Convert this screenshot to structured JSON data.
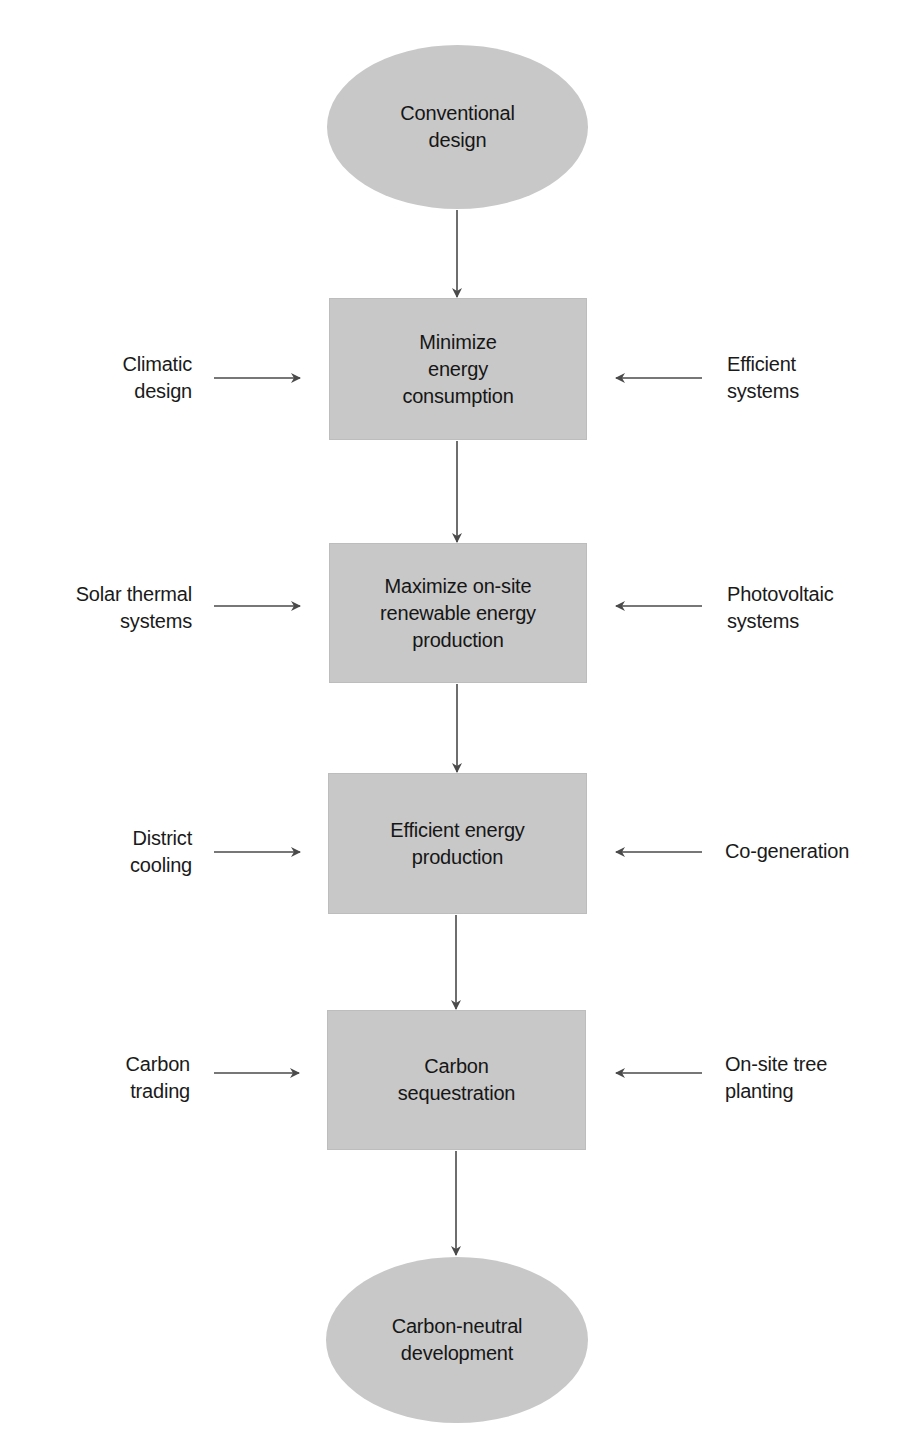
{
  "diagram": {
    "type": "flowchart",
    "colors": {
      "node_fill": "#c8c8c8",
      "arrow": "#4a4a4a",
      "text": "#1a1a1a",
      "background": "#ffffff"
    },
    "start": {
      "shape": "ellipse",
      "label": "Conventional\ndesign"
    },
    "steps": [
      {
        "label": "Minimize\nenergy\nconsumption",
        "left_input": "Climatic\ndesign",
        "right_input": "Efficient\nsystems"
      },
      {
        "label": "Maximize on-site\nrenewable energy\nproduction",
        "left_input": "Solar thermal\nsystems",
        "right_input": "Photovoltaic\nsystems"
      },
      {
        "label": "Efficient energy\nproduction",
        "left_input": "District\ncooling",
        "right_input": "Co-generation"
      },
      {
        "label": "Carbon\nsequestration",
        "left_input": "Carbon\ntrading",
        "right_input": "On-site tree\nplanting"
      }
    ],
    "end": {
      "shape": "ellipse",
      "label": "Carbon-neutral\ndevelopment"
    }
  }
}
